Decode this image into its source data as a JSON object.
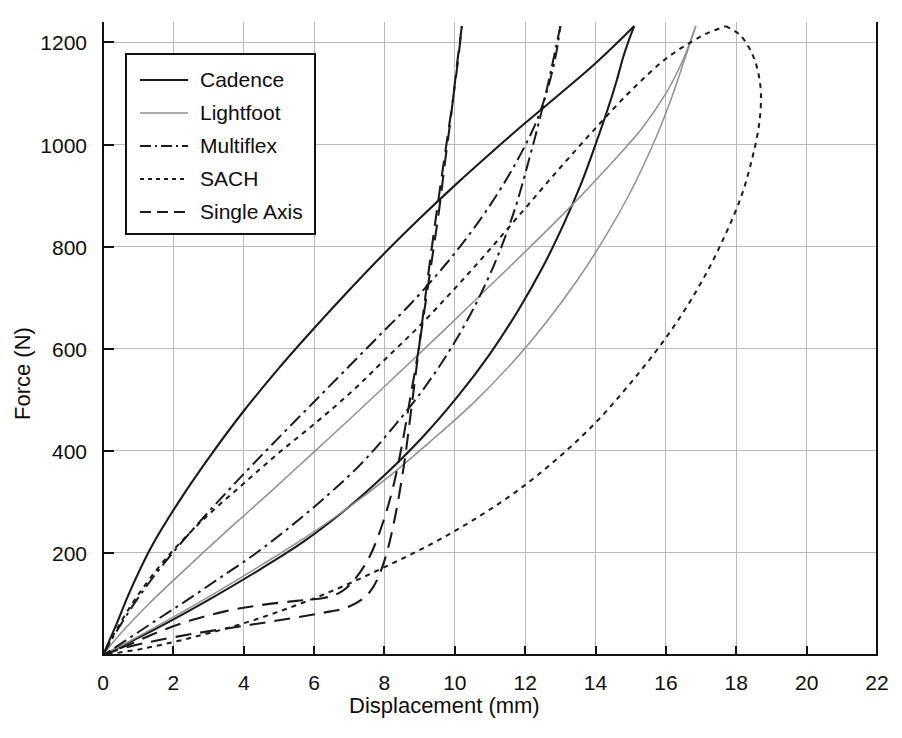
{
  "chart_data": {
    "type": "line",
    "title": "",
    "xlabel": "Displacement (mm)",
    "ylabel": "Force (N)",
    "xlim": [
      0,
      22
    ],
    "ylim": [
      0,
      1240
    ],
    "xticks": [
      0,
      2,
      4,
      6,
      8,
      10,
      12,
      14,
      16,
      18,
      20,
      22
    ],
    "yticks": [
      200,
      400,
      600,
      800,
      1000,
      1200
    ],
    "xtick_labels": [
      "0",
      "2",
      "4",
      "6",
      "8",
      "10",
      "12",
      "14",
      "16",
      "18",
      "20",
      "22"
    ],
    "ytick_labels": [
      "200",
      "400",
      "600",
      "800",
      "1000",
      "1200"
    ],
    "grid": true,
    "legend_position": "upper-left",
    "series": [
      {
        "name": "Cadence",
        "style": "solid",
        "color": "#1a1a1a",
        "width": 2.1,
        "dash": "none",
        "peak": [
          15.1,
          1232
        ],
        "loading": [
          [
            0,
            0
          ],
          [
            0.35,
            55
          ],
          [
            0.8,
            130
          ],
          [
            1.4,
            215
          ],
          [
            2.2,
            305
          ],
          [
            3.1,
            395
          ],
          [
            4.0,
            478
          ],
          [
            5.0,
            562
          ],
          [
            6.0,
            640
          ],
          [
            7.0,
            715
          ],
          [
            8.0,
            787
          ],
          [
            9.0,
            855
          ],
          [
            10.0,
            920
          ],
          [
            11.0,
            982
          ],
          [
            12.0,
            1042
          ],
          [
            13.0,
            1100
          ],
          [
            13.8,
            1147
          ],
          [
            14.4,
            1185
          ],
          [
            14.85,
            1215
          ],
          [
            15.1,
            1232
          ]
        ],
        "unloading": [
          [
            15.1,
            1232
          ],
          [
            14.95,
            1205
          ],
          [
            14.78,
            1170
          ],
          [
            14.6,
            1125
          ],
          [
            14.35,
            1070
          ],
          [
            14.0,
            1000
          ],
          [
            13.6,
            925
          ],
          [
            13.1,
            845
          ],
          [
            12.5,
            760
          ],
          [
            11.8,
            675
          ],
          [
            11.0,
            590
          ],
          [
            10.1,
            508
          ],
          [
            9.1,
            428
          ],
          [
            8.0,
            352
          ],
          [
            6.9,
            285
          ],
          [
            5.7,
            222
          ],
          [
            4.4,
            165
          ],
          [
            3.1,
            112
          ],
          [
            1.9,
            66
          ],
          [
            0.9,
            30
          ],
          [
            0,
            0
          ]
        ]
      },
      {
        "name": "Lightfoot",
        "style": "thin-solid",
        "color": "#8f8f8f",
        "width": 1.5,
        "dash": "none",
        "peak": [
          16.85,
          1232
        ],
        "loading": [
          [
            0,
            0
          ],
          [
            0.5,
            42
          ],
          [
            1.3,
            100
          ],
          [
            2.4,
            172
          ],
          [
            3.6,
            248
          ],
          [
            4.8,
            322
          ],
          [
            6.0,
            398
          ],
          [
            7.2,
            474
          ],
          [
            8.4,
            552
          ],
          [
            9.6,
            630
          ],
          [
            10.8,
            710
          ],
          [
            12.0,
            790
          ],
          [
            13.2,
            872
          ],
          [
            14.3,
            952
          ],
          [
            15.3,
            1030
          ],
          [
            16.0,
            1100
          ],
          [
            16.5,
            1168
          ],
          [
            16.85,
            1232
          ]
        ],
        "unloading": [
          [
            16.85,
            1232
          ],
          [
            16.5,
            1160
          ],
          [
            16.1,
            1080
          ],
          [
            15.6,
            995
          ],
          [
            15.0,
            908
          ],
          [
            14.3,
            822
          ],
          [
            13.5,
            736
          ],
          [
            12.6,
            652
          ],
          [
            11.6,
            570
          ],
          [
            10.5,
            492
          ],
          [
            9.3,
            418
          ],
          [
            8.1,
            348
          ],
          [
            6.9,
            285
          ],
          [
            5.7,
            228
          ],
          [
            4.5,
            176
          ],
          [
            3.4,
            130
          ],
          [
            2.4,
            90
          ],
          [
            1.5,
            55
          ],
          [
            0.7,
            25
          ],
          [
            0,
            0
          ]
        ]
      },
      {
        "name": "Multiflex",
        "style": "dash-dot",
        "color": "#1a1a1a",
        "width": 2.0,
        "dash": "14,5,3,5",
        "peak": [
          13.0,
          1232
        ],
        "loading": [
          [
            0,
            0
          ],
          [
            0.4,
            48
          ],
          [
            1.0,
            112
          ],
          [
            1.8,
            185
          ],
          [
            2.8,
            265
          ],
          [
            3.8,
            340
          ],
          [
            4.8,
            412
          ],
          [
            5.8,
            482
          ],
          [
            6.8,
            552
          ],
          [
            7.8,
            622
          ],
          [
            8.8,
            692
          ],
          [
            9.7,
            762
          ],
          [
            10.5,
            832
          ],
          [
            11.2,
            902
          ],
          [
            11.8,
            972
          ],
          [
            12.3,
            1042
          ],
          [
            12.65,
            1112
          ],
          [
            12.88,
            1178
          ],
          [
            13.0,
            1232
          ]
        ],
        "unloading": [
          [
            13.0,
            1232
          ],
          [
            12.75,
            1150
          ],
          [
            12.45,
            1060
          ],
          [
            12.1,
            968
          ],
          [
            11.7,
            872
          ],
          [
            11.2,
            778
          ],
          [
            10.6,
            688
          ],
          [
            9.9,
            602
          ],
          [
            9.1,
            520
          ],
          [
            8.2,
            442
          ],
          [
            7.3,
            372
          ],
          [
            6.3,
            308
          ],
          [
            5.3,
            250
          ],
          [
            4.3,
            197
          ],
          [
            3.3,
            150
          ],
          [
            2.4,
            108
          ],
          [
            1.6,
            72
          ],
          [
            0.9,
            40
          ],
          [
            0.35,
            15
          ],
          [
            0,
            0
          ]
        ]
      },
      {
        "name": "SACH",
        "style": "dotted",
        "color": "#1a1a1a",
        "width": 2.0,
        "dash": "5,5",
        "peak": [
          18.7,
          1232
        ],
        "loading": [
          [
            0,
            0
          ],
          [
            0.4,
            52
          ],
          [
            1.0,
            118
          ],
          [
            1.8,
            190
          ],
          [
            2.8,
            262
          ],
          [
            3.9,
            330
          ],
          [
            5.0,
            396
          ],
          [
            6.1,
            458
          ],
          [
            7.1,
            518
          ],
          [
            8.0,
            578
          ],
          [
            9.0,
            645
          ],
          [
            10.0,
            718
          ],
          [
            11.0,
            795
          ],
          [
            12.0,
            875
          ],
          [
            13.0,
            955
          ],
          [
            14.0,
            1032
          ],
          [
            15.0,
            1105
          ],
          [
            16.0,
            1168
          ],
          [
            17.0,
            1212
          ],
          [
            17.7,
            1232
          ]
        ],
        "unloading": [
          [
            17.7,
            1232
          ],
          [
            18.1,
            1215
          ],
          [
            18.4,
            1185
          ],
          [
            18.6,
            1148
          ],
          [
            18.7,
            1100
          ],
          [
            18.65,
            1040
          ],
          [
            18.45,
            972
          ],
          [
            18.15,
            900
          ],
          [
            17.7,
            825
          ],
          [
            17.15,
            748
          ],
          [
            16.5,
            672
          ],
          [
            15.75,
            598
          ],
          [
            14.9,
            525
          ],
          [
            14.0,
            455
          ],
          [
            13.0,
            390
          ],
          [
            11.9,
            328
          ],
          [
            10.7,
            272
          ],
          [
            9.4,
            220
          ],
          [
            8.0,
            172
          ],
          [
            6.6,
            128
          ],
          [
            5.2,
            90
          ],
          [
            3.8,
            58
          ],
          [
            2.4,
            32
          ],
          [
            1.1,
            12
          ],
          [
            0,
            0
          ]
        ]
      },
      {
        "name": "Single Axis",
        "style": "dashed",
        "color": "#1a1a1a",
        "width": 2.1,
        "dash": "16,9",
        "peak": [
          10.2,
          1232
        ],
        "loading": [
          [
            0,
            0
          ],
          [
            0.6,
            14
          ],
          [
            1.5,
            28
          ],
          [
            2.6,
            42
          ],
          [
            3.8,
            55
          ],
          [
            5.0,
            68
          ],
          [
            6.2,
            82
          ],
          [
            7.0,
            95
          ],
          [
            7.6,
            125
          ],
          [
            8.0,
            185
          ],
          [
            8.3,
            270
          ],
          [
            8.55,
            370
          ],
          [
            8.75,
            475
          ],
          [
            8.95,
            585
          ],
          [
            9.15,
            695
          ],
          [
            9.35,
            800
          ],
          [
            9.55,
            900
          ],
          [
            9.75,
            995
          ],
          [
            9.95,
            1090
          ],
          [
            10.1,
            1170
          ],
          [
            10.2,
            1232
          ]
        ],
        "unloading": [
          [
            10.2,
            1232
          ],
          [
            10.05,
            1150
          ],
          [
            9.9,
            1060
          ],
          [
            9.72,
            965
          ],
          [
            9.55,
            870
          ],
          [
            9.35,
            775
          ],
          [
            9.15,
            682
          ],
          [
            8.95,
            590
          ],
          [
            8.72,
            498
          ],
          [
            8.5,
            412
          ],
          [
            8.25,
            330
          ],
          [
            7.95,
            258
          ],
          [
            7.6,
            196
          ],
          [
            7.2,
            152
          ],
          [
            6.8,
            125
          ],
          [
            6.3,
            112
          ],
          [
            5.5,
            106
          ],
          [
            4.5,
            98
          ],
          [
            3.5,
            86
          ],
          [
            2.5,
            68
          ],
          [
            1.6,
            46
          ],
          [
            0.8,
            22
          ],
          [
            0,
            0
          ]
        ]
      }
    ]
  },
  "legend": {
    "entries": [
      {
        "label": "Cadence"
      },
      {
        "label": "Lightfoot"
      },
      {
        "label": "Multiflex"
      },
      {
        "label": "SACH"
      },
      {
        "label": "Single Axis"
      }
    ]
  }
}
